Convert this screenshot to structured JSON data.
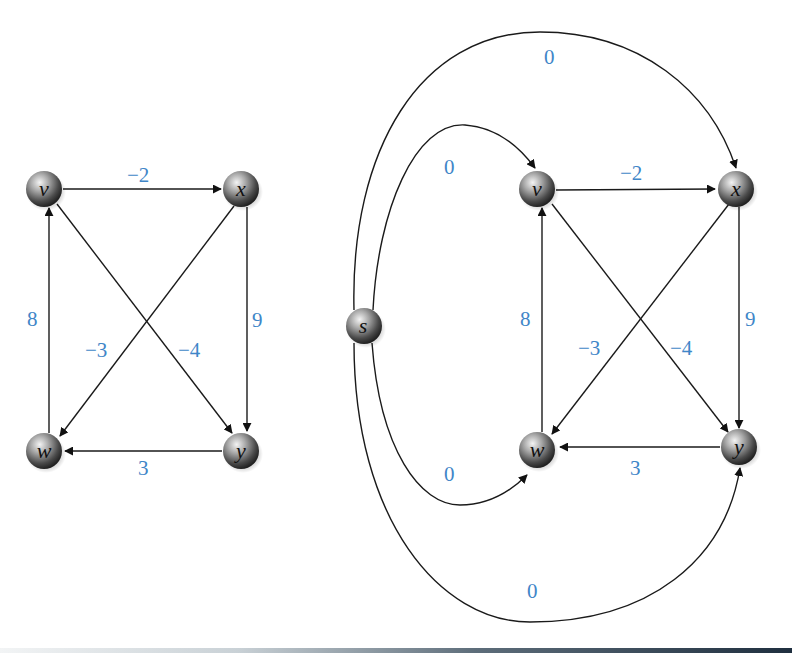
{
  "diagram": {
    "type": "directed-weighted-graph",
    "weight_color": "#3f86c8",
    "graphs": [
      {
        "name": "original-graph",
        "nodes": [
          {
            "id": "v",
            "label": "v",
            "x": 44,
            "y": 189
          },
          {
            "id": "x",
            "label": "x",
            "x": 241,
            "y": 189
          },
          {
            "id": "w",
            "label": "w",
            "x": 44,
            "y": 451
          },
          {
            "id": "y",
            "label": "y",
            "x": 241,
            "y": 451
          }
        ],
        "edges": [
          {
            "from": "v",
            "to": "x",
            "weight": "−2"
          },
          {
            "from": "x",
            "to": "y",
            "weight": "9"
          },
          {
            "from": "x",
            "to": "w",
            "weight": "−3"
          },
          {
            "from": "v",
            "to": "y",
            "weight": "−4"
          },
          {
            "from": "y",
            "to": "w",
            "weight": "3"
          },
          {
            "from": "w",
            "to": "v",
            "weight": "8"
          }
        ]
      },
      {
        "name": "augmented-graph",
        "nodes": [
          {
            "id": "s",
            "label": "s",
            "x": 364,
            "y": 326
          },
          {
            "id": "v",
            "label": "v",
            "x": 537,
            "y": 189
          },
          {
            "id": "x",
            "label": "x",
            "x": 736,
            "y": 189
          },
          {
            "id": "w",
            "label": "w",
            "x": 537,
            "y": 450
          },
          {
            "id": "y",
            "label": "y",
            "x": 739,
            "y": 447
          }
        ],
        "edges": [
          {
            "from": "v",
            "to": "x",
            "weight": "−2"
          },
          {
            "from": "x",
            "to": "y",
            "weight": "9"
          },
          {
            "from": "x",
            "to": "w",
            "weight": "−3"
          },
          {
            "from": "v",
            "to": "y",
            "weight": "−4"
          },
          {
            "from": "y",
            "to": "w",
            "weight": "3"
          },
          {
            "from": "w",
            "to": "v",
            "weight": "8"
          },
          {
            "from": "s",
            "to": "x",
            "weight": "0"
          },
          {
            "from": "s",
            "to": "v",
            "weight": "0"
          },
          {
            "from": "s",
            "to": "w",
            "weight": "0"
          },
          {
            "from": "s",
            "to": "y",
            "weight": "0"
          }
        ]
      }
    ],
    "labels": {
      "g1": {
        "v": "v",
        "x": "x",
        "w": "w",
        "y": "y",
        "e_vx": "−2",
        "e_xy": "9",
        "e_xw": "−3",
        "e_vy": "−4",
        "e_yw": "3",
        "e_wv": "8"
      },
      "g2": {
        "s": "s",
        "v": "v",
        "x": "x",
        "w": "w",
        "y": "y",
        "e_vx": "−2",
        "e_xy": "9",
        "e_xw": "−3",
        "e_vy": "−4",
        "e_yw": "3",
        "e_wv": "8",
        "e_sx": "0",
        "e_sv": "0",
        "e_sw": "0",
        "e_sy": "0"
      }
    }
  }
}
